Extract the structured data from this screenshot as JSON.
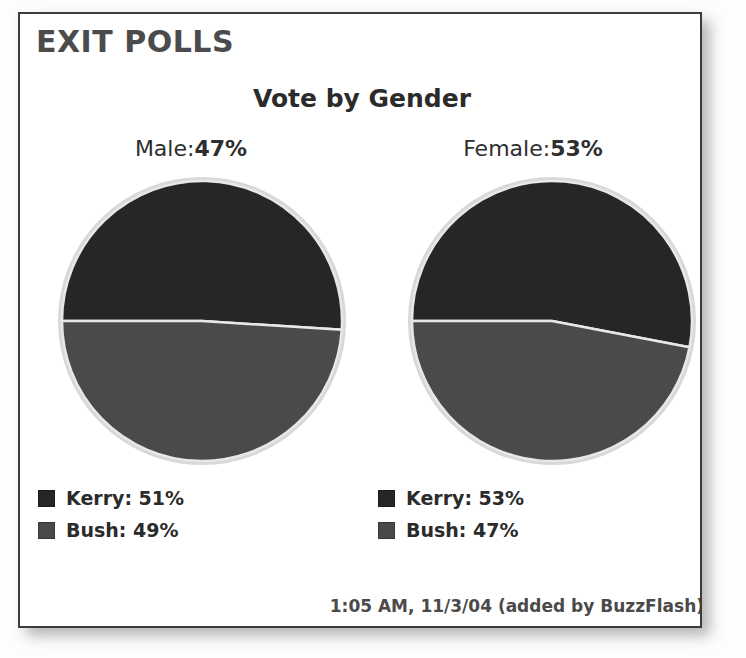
{
  "card": {
    "header_title": "EXIT POLLS",
    "footer_note": "1:05 AM, 11/3/04 (added by BuzzFlash)"
  },
  "chart_data": {
    "type": "pie",
    "title": "Vote by Gender",
    "xlabel": "",
    "ylabel": "",
    "legend_position": "below",
    "grid": false,
    "colors": {
      "kerry": "#262626",
      "bush": "#4a4a4a",
      "slice_divider": "#e8e8e8",
      "pie_outline": "#d8d8d8"
    },
    "panels": [
      {
        "group": "Male",
        "group_label": "Male:",
        "group_share_pct": "47%",
        "group_share_value": 47,
        "labels": [
          "Kerry",
          "Bush"
        ],
        "values": [
          51,
          49
        ],
        "legend": [
          {
            "name": "Kerry",
            "text": "Kerry: 51%",
            "value": 51,
            "color": "#262626"
          },
          {
            "name": "Bush",
            "text": "Bush: 49%",
            "value": 49,
            "color": "#4a4a4a"
          }
        ]
      },
      {
        "group": "Female",
        "group_label": "Female:",
        "group_share_pct": "53%",
        "group_share_value": 53,
        "labels": [
          "Kerry",
          "Bush"
        ],
        "values": [
          53,
          47
        ],
        "legend": [
          {
            "name": "Kerry",
            "text": "Kerry: 53%",
            "value": 53,
            "color": "#262626"
          },
          {
            "name": "Bush",
            "text": "Bush: 47%",
            "value": 47,
            "color": "#4a4a4a"
          }
        ]
      }
    ]
  }
}
